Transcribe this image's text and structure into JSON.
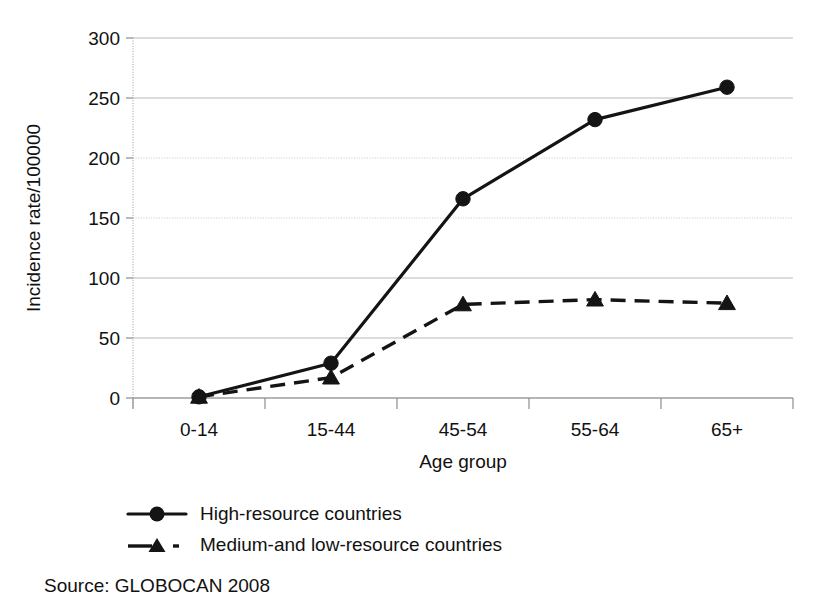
{
  "chart_data": {
    "type": "line",
    "title": "",
    "subtitle": "",
    "xlabel": "Age group",
    "ylabel": "Incidence rate/100000",
    "categories": [
      "0-14",
      "15-44",
      "45-54",
      "55-64",
      "65+"
    ],
    "series": [
      {
        "name": "High-resource countries",
        "marker": "circle",
        "linestyle": "solid",
        "color": "#141414",
        "values": [
          1,
          29,
          166,
          232,
          259
        ]
      },
      {
        "name": "Medium-and low-resource countries",
        "marker": "triangle",
        "linestyle": "dashed",
        "color": "#141414",
        "values": [
          1,
          17,
          78,
          82,
          79
        ]
      }
    ],
    "ylim": [
      0,
      300
    ],
    "yticks": [
      0,
      50,
      100,
      150,
      200,
      250,
      300
    ],
    "ytick_labels": [
      "0",
      "50",
      "100",
      "150",
      "200",
      "250",
      "300"
    ],
    "grid": true,
    "grid_axis": "y",
    "legend_position": "below-plot-left",
    "annotations": [
      {
        "name": "source",
        "text": "Source: GLOBOCAN 2008"
      }
    ]
  },
  "figure": {
    "source_note": "Source: GLOBOCAN 2008"
  },
  "legend": {
    "items": [
      {
        "label": "High-resource countries",
        "marker": "circle-marker-icon"
      },
      {
        "label": "Medium-and low-resource countries",
        "marker": "triangle-marker-icon"
      }
    ]
  }
}
